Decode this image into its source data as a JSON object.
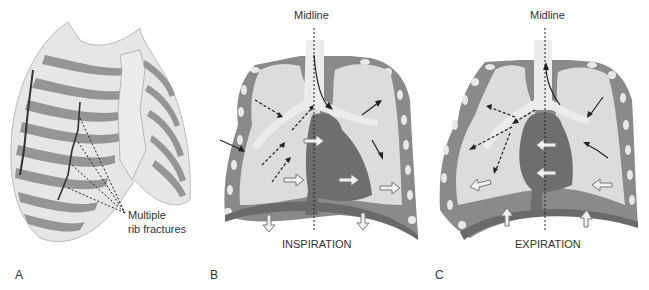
{
  "panels": {
    "a": {
      "letter": "A",
      "annotation_line1": "Multiple",
      "annotation_line2": "rib fractures"
    },
    "b": {
      "letter": "B",
      "top_label": "Midline",
      "bottom_label": "INSPIRATION"
    },
    "c": {
      "letter": "C",
      "top_label": "Midline",
      "bottom_label": "EXPIRATION"
    }
  },
  "colors": {
    "lung_fill": "#dcdcdc",
    "chest_wall": "#8a8a8a",
    "heart": "#6e6e6e",
    "rib_bone": "#e8e8e8",
    "rib_shade": "#7a7a7a"
  }
}
